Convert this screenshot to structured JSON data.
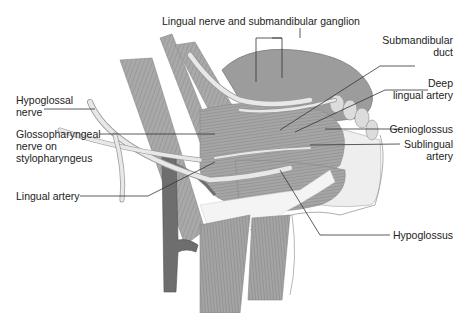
{
  "diagram": {
    "colors": {
      "background": "#ffffff",
      "muscle": "#a8a8a8",
      "muscle_dark": "#8a8a8a",
      "gland": "#9a9a9a",
      "nerve": "#e4e4e4",
      "artery": "#6e6e6e",
      "mucosa": "#ececec",
      "leader": "#333333",
      "text": "#222222"
    },
    "labels": {
      "lingual_nerve": "Lingual nerve and submandibular ganglion",
      "submandibular_duct_1": "Submandibular",
      "submandibular_duct_2": "duct",
      "deep_lingual_1": "Deep",
      "deep_lingual_2": "lingual artery",
      "hypoglossal_nerve_1": "Hypoglossal",
      "hypoglossal_nerve_2": "nerve",
      "glossopharyngeal_1": "Glossopharyngeal",
      "glossopharyngeal_2": "nerve on",
      "glossopharyngeal_3": "stylopharyngeus",
      "genioglossus": "Genioglossus",
      "sublingual_1": "Sublingual",
      "sublingual_2": "artery",
      "lingual_artery": "Lingual artery",
      "hypoglossus": "Hypoglossus"
    }
  }
}
